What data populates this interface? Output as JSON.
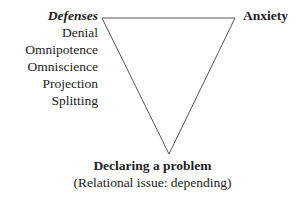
{
  "diagram": {
    "type": "inverted-triangle",
    "vertices": {
      "top_left": {
        "heading": "Defenses",
        "items": [
          "Denial",
          "Omnipotence",
          "Omniscience",
          "Projection",
          "Splitting"
        ]
      },
      "top_right": {
        "label": "Anxiety"
      },
      "bottom": {
        "label": "Declaring a problem",
        "sublabel": "(Relational issue: depending)"
      }
    },
    "line_color": "#555555"
  }
}
